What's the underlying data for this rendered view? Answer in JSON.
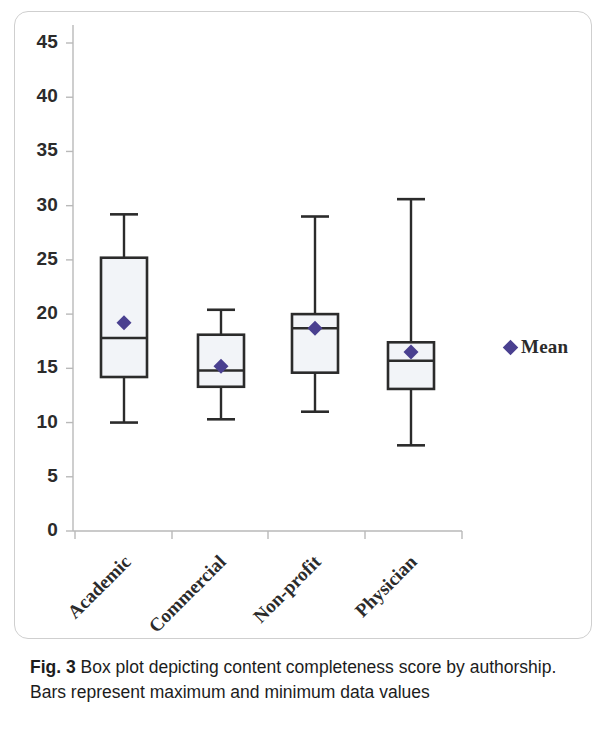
{
  "figure": {
    "caption_label": "Fig. 3",
    "caption_text": "Box plot depicting content completeness score by authorship.",
    "caption_text_line2": "Bars represent maximum and minimum data values"
  },
  "legend": {
    "marker_icon": "diamond-icon",
    "label": "Mean",
    "color": "#4a4090"
  },
  "chart_data": {
    "type": "box",
    "title": "",
    "xlabel": "",
    "ylabel": "",
    "ylim": [
      0,
      45
    ],
    "ytick_interval": 5,
    "yticks": [
      "45",
      "40",
      "35",
      "30",
      "25",
      "20",
      "15",
      "10",
      "5",
      "0"
    ],
    "grid": false,
    "legend_position": "right",
    "categories": [
      "Academic",
      "Commercial",
      "Non-profit",
      "Physician"
    ],
    "boxes": [
      {
        "category": "Academic",
        "min": 10.0,
        "q1": 14.2,
        "median": 17.8,
        "q3": 25.2,
        "max": 29.2,
        "mean": 19.2
      },
      {
        "category": "Commercial",
        "min": 10.3,
        "q1": 13.3,
        "median": 14.8,
        "q3": 18.1,
        "max": 20.4,
        "mean": 15.2
      },
      {
        "category": "Non-profit",
        "min": 11.0,
        "q1": 14.6,
        "median": 18.7,
        "q3": 20.0,
        "max": 29.0,
        "mean": 18.7
      },
      {
        "category": "Physician",
        "min": 7.9,
        "q1": 13.1,
        "median": 15.7,
        "q3": 17.4,
        "max": 30.6,
        "mean": 16.5
      }
    ],
    "box_fill": "#f2f4f8",
    "box_stroke": "#2b2b2b",
    "mean_marker_color": "#4a4090"
  }
}
